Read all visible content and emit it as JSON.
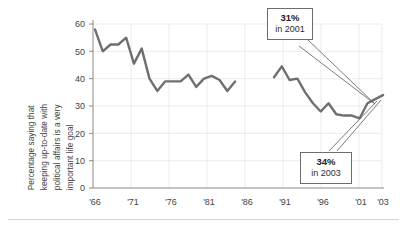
{
  "figure": {
    "background_color": "#ffffff",
    "line_color": "#6f6f6f",
    "axis_color": "#8a8a8a",
    "grid_color": "#e3e3e3",
    "bottom_rule": true
  },
  "axis": {
    "y_title_lines": [
      "Percentage saying that",
      "keeping up-to-date with",
      "political affairs is a very",
      "important life goal"
    ],
    "y_ticks": [
      "0",
      "10",
      "20",
      "30",
      "40",
      "50",
      "60"
    ],
    "x_ticks": [
      "'66",
      "'71",
      "'76",
      "'81",
      "'86",
      "'91",
      "'96",
      "'01",
      "'03"
    ]
  },
  "callouts": [
    {
      "name": "callout-2001",
      "value": "31%",
      "label": "in 2001"
    },
    {
      "name": "callout-2003",
      "value": "34%",
      "label": "in 2003"
    }
  ],
  "chart_data": {
    "type": "line",
    "title": "",
    "xlabel": "",
    "ylabel": "Percentage saying that keeping up-to-date with political affairs is a very important life goal",
    "ylim": [
      0,
      60
    ],
    "xlim": [
      1966,
      2003
    ],
    "yticks": [
      0,
      10,
      20,
      30,
      40,
      50,
      60
    ],
    "xtick_years": [
      1966,
      1971,
      1976,
      1981,
      1986,
      1991,
      1996,
      2001,
      2003
    ],
    "xtick_labels": [
      "'66",
      "'71",
      "'76",
      "'81",
      "'86",
      "'91",
      "'96",
      "'01",
      "'03"
    ],
    "grid": "horizontal-and-vertical-faint",
    "legend": "none",
    "series": [
      {
        "name": "1966-1984",
        "x": [
          1966,
          1967,
          1968,
          1969,
          1970,
          1971,
          1972,
          1973,
          1974,
          1975,
          1976,
          1977,
          1978,
          1979,
          1980,
          1981,
          1982,
          1983,
          1984
        ],
        "values": [
          58,
          50,
          52.5,
          52.5,
          55,
          45.5,
          51,
          40,
          35.5,
          39,
          39,
          39,
          41.5,
          37,
          40,
          41,
          39.5,
          35.5,
          39
        ]
      },
      {
        "name": "1989-2003",
        "x": [
          1989,
          1990,
          1991,
          1992,
          1993,
          1994,
          1995,
          1996,
          1997,
          1998,
          1999,
          2000,
          2001,
          2002,
          2003
        ],
        "values": [
          40.5,
          44.5,
          39.5,
          40,
          35,
          31,
          28,
          31,
          27,
          26.5,
          26.5,
          25.5,
          31,
          32.5,
          34
        ]
      }
    ],
    "annotations": [
      {
        "text": "31%\nin 2001",
        "value": 31,
        "year": 2001
      },
      {
        "text": "34%\nin 2003",
        "value": 34,
        "year": 2003
      }
    ]
  }
}
